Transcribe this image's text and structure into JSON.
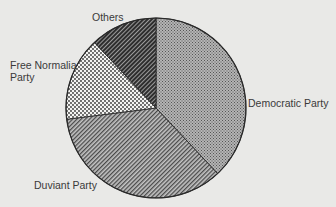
{
  "chart_data": {
    "type": "pie",
    "title": "",
    "start_angle_deg": 0,
    "direction": "clockwise",
    "slices": [
      {
        "label": "Democratic Party",
        "value": 38,
        "pattern": "fine-crosshatch",
        "color": "#8c8c8c"
      },
      {
        "label": "Duviant Party",
        "value": 35,
        "pattern": "diagonal-hatch",
        "color": "#6f6f6f"
      },
      {
        "label": "Free Normalia Party",
        "value": 15,
        "pattern": "dots",
        "color": "#f2f2f2"
      },
      {
        "label": "Others",
        "value": 12,
        "pattern": "dense-diagonal-hatch",
        "color": "#4a4a4a"
      }
    ]
  },
  "labels": {
    "democratic": "Democratic Party",
    "duviant": "Duviant Party",
    "free_normalia": "Free Normalia\nParty",
    "others": "Others"
  },
  "colors": {
    "background": "#e9e9e7",
    "outline": "#2a2a2a"
  }
}
